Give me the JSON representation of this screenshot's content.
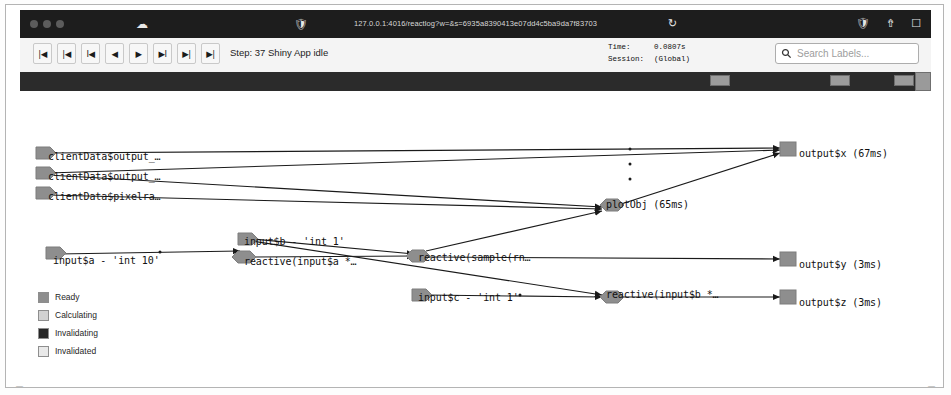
{
  "window": {
    "url": "127.0.0.1:4016/reactlog?w=&s=6935a8390413e07dd4c5ba9da7f83703",
    "traffic_lights": [
      "close",
      "minimize",
      "maximize"
    ],
    "icons": {
      "cloud": "cloud-icon",
      "shield": "shield-icon",
      "reload": "reload-icon",
      "extension": "extension-icon",
      "share": "share-icon",
      "tabs": "tabs-icon"
    }
  },
  "toolbar": {
    "nav_buttons": [
      {
        "name": "jump-to-start-button",
        "glyph": "|◀"
      },
      {
        "name": "previous-frame-button",
        "glyph": "|◀"
      },
      {
        "name": "step-back-button",
        "glyph": "I◀"
      },
      {
        "name": "play-backward-button",
        "glyph": "◀"
      },
      {
        "name": "play-forward-button",
        "glyph": "▶"
      },
      {
        "name": "step-forward-button",
        "glyph": "▶I"
      },
      {
        "name": "next-frame-button",
        "glyph": "▶|"
      },
      {
        "name": "jump-to-end-button",
        "glyph": "▶|"
      }
    ],
    "step_label": "Step: 37  Shiny App idle",
    "time_key": "Time:",
    "time_value": "0.0807s",
    "session_key": "Session:",
    "session_value": "(Global)",
    "search_placeholder": "Search Labels...",
    "search_value": ""
  },
  "legend": {
    "items": [
      {
        "label": "Ready",
        "color": "#8e8e8e"
      },
      {
        "label": "Calculating",
        "color": "#d2d2d2"
      },
      {
        "label": "Invalidating",
        "color": "#262626"
      },
      {
        "label": "Invalidated",
        "color": "#e9e9e9"
      }
    ]
  },
  "graph": {
    "nodes": [
      {
        "id": "clientdata-output-1",
        "label": "clientData$output_…",
        "x": 28,
        "y": 67,
        "shape": "flag",
        "state": "ready"
      },
      {
        "id": "clientdata-output-2",
        "label": "clientData$output_…",
        "x": 28,
        "y": 87,
        "shape": "flag",
        "state": "ready"
      },
      {
        "id": "clientdata-pixelratio",
        "label": "clientData$pixelra…",
        "x": 28,
        "y": 107,
        "shape": "flag",
        "state": "ready"
      },
      {
        "id": "input-a",
        "label": "input$a - 'int 10'",
        "x": 33,
        "y": 168,
        "shape": "flag",
        "state": "ready"
      },
      {
        "id": "input-b",
        "label": "input$b - 'int 1'",
        "x": 224,
        "y": 152,
        "shape": "flag",
        "state": "ready"
      },
      {
        "id": "input-c",
        "label": "input$c - 'int 1'",
        "x": 398,
        "y": 208,
        "shape": "flag",
        "state": "ready"
      },
      {
        "id": "reactive-input-a",
        "label": "reactive(input$a *…",
        "x": 224,
        "y": 172,
        "shape": "hex",
        "state": "ready"
      },
      {
        "id": "reactive-sample",
        "label": "reactive(sample(rn…",
        "x": 398,
        "y": 168,
        "shape": "hex",
        "state": "ready"
      },
      {
        "id": "reactive-input-b",
        "label": "reactive(input$b *…",
        "x": 586,
        "y": 205,
        "shape": "hex",
        "state": "ready"
      },
      {
        "id": "plotobj",
        "label": "plotObj (65ms)",
        "x": 586,
        "y": 115,
        "shape": "hex",
        "state": "ready"
      },
      {
        "id": "output-x",
        "label": "output$x (67ms)",
        "x": 763,
        "y": 55,
        "shape": "square",
        "state": "ready"
      },
      {
        "id": "output-y",
        "label": "output$y (3ms)",
        "x": 763,
        "y": 168,
        "shape": "square",
        "state": "ready"
      },
      {
        "id": "output-z",
        "label": "output$z (3ms)",
        "x": 763,
        "y": 205,
        "shape": "square",
        "state": "ready"
      }
    ]
  }
}
